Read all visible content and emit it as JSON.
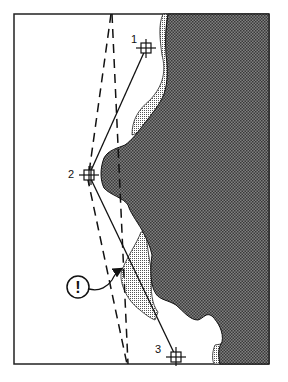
{
  "diagram": {
    "type": "navigation-fix-diagram",
    "colors": {
      "background": "#ffffff",
      "frame": "#222222",
      "land": "#6b6b6b",
      "land_pattern_dot": "#2e2e2e",
      "shallow": "#d0d0d0",
      "line": "#111111"
    },
    "points": [
      {
        "label": "1",
        "x": 146,
        "y": 48
      },
      {
        "label": "2",
        "x": 89,
        "y": 175
      },
      {
        "label": "3",
        "x": 176,
        "y": 357
      }
    ],
    "warning": {
      "symbol": "!",
      "x": 78,
      "y": 287
    },
    "legend_note": "Dashed line: safe clearing bearing; solid lines: course legs from point 1 to 2 to 3"
  }
}
